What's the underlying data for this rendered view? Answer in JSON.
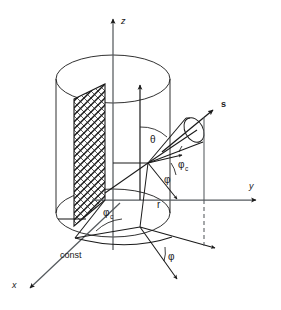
{
  "figure": {
    "background_color": "#ffffff",
    "line_color": "#1a1a1a",
    "hatch_color": "#1a1a1a"
  },
  "axes": [
    {
      "key": "z",
      "label": "z",
      "direction": "up",
      "style": "italic"
    },
    {
      "key": "y",
      "label": "y",
      "direction": "right",
      "style": "italic"
    },
    {
      "key": "x",
      "label": "x",
      "direction": "down-left",
      "style": "italic"
    }
  ],
  "vectors": [
    {
      "key": "s",
      "label": "s",
      "description": "direction-of-flight unit vector",
      "weight": "bold"
    },
    {
      "key": "r",
      "label": "r",
      "description": "radial coordinate vector",
      "weight": "normal"
    }
  ],
  "angles": [
    {
      "key": "theta",
      "label": "θ",
      "subscript": "",
      "description": "polar angle between z-axis and s"
    },
    {
      "key": "phi_c_1",
      "label": "φ",
      "subscript": "c",
      "description": "azimuth of cone axis, upper"
    },
    {
      "key": "phi_1",
      "label": "φ",
      "subscript": "",
      "description": "azimuth angle, upper"
    },
    {
      "key": "phi_c_2",
      "label": "φ",
      "subscript": "c",
      "description": "azimuth of plane, lower"
    },
    {
      "key": "phi_2",
      "label": "φ",
      "subscript": "",
      "description": "azimuth angle, lower"
    }
  ],
  "annotations": [
    {
      "key": "const",
      "label": "const",
      "description": "label of the hatched constant-azimuth plane"
    }
  ],
  "shapes": {
    "cylinder": {
      "name": "cylinder",
      "top_ellipse": true,
      "bottom_ellipse": true
    },
    "hatched_plane": {
      "name": "phi-const-plane",
      "fill": "cross-hatch"
    },
    "cone": {
      "name": "solid-angle-cone",
      "cap": "ellipse"
    },
    "dashed_drop": {
      "name": "projection-dashed-line",
      "dash": "4,3"
    }
  }
}
